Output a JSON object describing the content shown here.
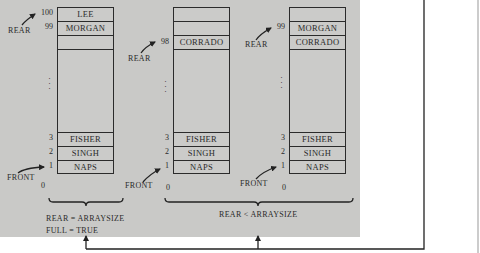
{
  "figure": {
    "queues": [
      {
        "id": "queue-full",
        "top_cells": [
          {
            "index": "100",
            "value": "LEE"
          },
          {
            "index": "99",
            "value": "MORGAN"
          },
          {
            "index": "",
            "value": ""
          }
        ],
        "bottom_cells": [
          {
            "index": "3",
            "value": "FISHER"
          },
          {
            "index": "2",
            "value": "SINGH"
          },
          {
            "index": "1",
            "value": "NAPS"
          }
        ],
        "zero_index": "0",
        "rear_label": "REAR",
        "rear_points_to": "100",
        "front_label": "FRONT",
        "front_points_to": "1",
        "ellipsis": "⋮"
      },
      {
        "id": "queue-partial-98",
        "top_cells": [
          {
            "index": "",
            "value": ""
          },
          {
            "index": "",
            "value": ""
          },
          {
            "index": "98",
            "value": "CORRADO"
          }
        ],
        "bottom_cells": [
          {
            "index": "3",
            "value": "FISHER"
          },
          {
            "index": "2",
            "value": "SINGH"
          },
          {
            "index": "1",
            "value": "NAPS"
          }
        ],
        "zero_index": "0",
        "rear_label": "REAR",
        "rear_points_to": "98",
        "front_label": "FRONT",
        "front_points_to": "1",
        "ellipsis": "⋮"
      },
      {
        "id": "queue-partial-99",
        "top_cells": [
          {
            "index": "",
            "value": ""
          },
          {
            "index": "99",
            "value": "MORGAN"
          },
          {
            "index": "",
            "value": "CORRADO"
          }
        ],
        "bottom_cells": [
          {
            "index": "3",
            "value": "FISHER"
          },
          {
            "index": "2",
            "value": "SINGH"
          },
          {
            "index": "1",
            "value": "NAPS"
          }
        ],
        "zero_index": "0",
        "rear_label": "REAR",
        "rear_points_to": "99",
        "front_label": "FRONT",
        "front_points_to": "1",
        "ellipsis": "⋮"
      }
    ],
    "captions": {
      "full_line1": "REAR = ARRAYSIZE",
      "full_line2": "FULL = TRUE",
      "partial": "REAR < ARRAYSIZE"
    },
    "colors": {
      "panel": "#c9c9c7",
      "line": "#2b2b2b",
      "background": "#ffffff"
    }
  }
}
